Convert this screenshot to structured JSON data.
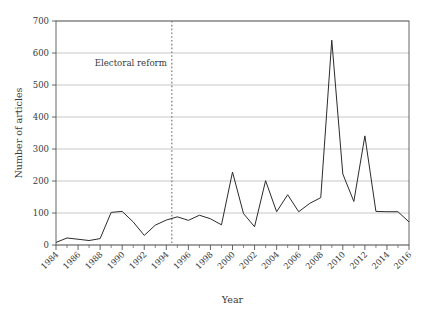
{
  "chart_data": {
    "type": "line",
    "title": "",
    "xlabel": "Year",
    "ylabel": "Number of articles",
    "xlim": [
      1984,
      2016
    ],
    "ylim": [
      0,
      700
    ],
    "grid": true,
    "legend": null,
    "y_ticks": [
      0,
      100,
      200,
      300,
      400,
      500,
      600,
      700
    ],
    "y_tick_labels": [
      "0",
      "100",
      "200",
      "300",
      "400",
      "500",
      "600",
      "700"
    ],
    "x_ticks": [
      1984,
      1986,
      1988,
      1990,
      1992,
      1994,
      1996,
      1998,
      2000,
      2002,
      2004,
      2006,
      2008,
      2010,
      2012,
      2014,
      2016
    ],
    "x_tick_labels": [
      "1984",
      "1986",
      "1988",
      "1990",
      "1992",
      "1994",
      "1996",
      "1998",
      "2000",
      "2002",
      "2004",
      "2006",
      "2008",
      "2010",
      "2012",
      "2014",
      "2016"
    ],
    "x_minor_ticks": [
      1985,
      1987,
      1989,
      1991,
      1993,
      1995,
      1997,
      1999,
      2001,
      2003,
      2005,
      2007,
      2009,
      2011,
      2013,
      2015
    ],
    "x": [
      1984,
      1985,
      1986,
      1987,
      1988,
      1989,
      1990,
      1991,
      1992,
      1993,
      1994,
      1995,
      1996,
      1997,
      1998,
      1999,
      2000,
      2001,
      2002,
      2003,
      2004,
      2005,
      2006,
      2007,
      2008,
      2009,
      2010,
      2011,
      2012,
      2013,
      2014,
      2015,
      2016
    ],
    "series": [
      {
        "name": "Number of articles",
        "color": "#2b2b2b",
        "values": [
          8,
          22,
          18,
          14,
          20,
          102,
          105,
          72,
          30,
          62,
          78,
          88,
          77,
          93,
          82,
          63,
          228,
          98,
          57,
          201,
          104,
          157,
          104,
          130,
          148,
          640,
          222,
          136,
          341,
          105,
          104,
          104,
          72
        ]
      }
    ],
    "annotations": [
      {
        "name": "electoral-reform-marker",
        "label": "Electoral reform",
        "x": 1994.5,
        "label_y": 560,
        "line_style": "dotted",
        "color": "#6d6d6d"
      }
    ],
    "colors": {
      "line": "#2b2b2b",
      "grid": "#b9b9b9",
      "frame": "#555555",
      "text": "#3a3a3a",
      "background": "#ffffff",
      "annotation": "#6d6d6d"
    }
  }
}
